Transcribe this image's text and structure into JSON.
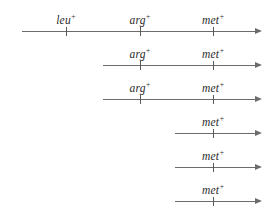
{
  "figure": {
    "type": "genetic-map-conjugation-diagram",
    "background_color": "#ffffff",
    "line_color": "#6c6c6c",
    "tick_color": "#5a5a5a",
    "label_color": "#2b2b2b",
    "canvas": {
      "width": 277,
      "height": 221
    },
    "arrow_tip_x": 262,
    "rows": [
      {
        "row_index": 1,
        "y": 31,
        "line_start_x": 22,
        "line_end_x": 255,
        "markers": [
          {
            "gene": "leu",
            "charge": "+",
            "x": 66
          },
          {
            "gene": "arg",
            "charge": "+",
            "x": 140
          },
          {
            "gene": "met",
            "charge": "+",
            "x": 213
          }
        ]
      },
      {
        "row_index": 2,
        "y": 65,
        "line_start_x": 103,
        "line_end_x": 255,
        "markers": [
          {
            "gene": "arg",
            "charge": "+",
            "x": 140
          },
          {
            "gene": "met",
            "charge": "+",
            "x": 213
          }
        ]
      },
      {
        "row_index": 3,
        "y": 99,
        "line_start_x": 103,
        "line_end_x": 255,
        "markers": [
          {
            "gene": "arg",
            "charge": "+",
            "x": 140
          },
          {
            "gene": "met",
            "charge": "+",
            "x": 213
          }
        ]
      },
      {
        "row_index": 4,
        "y": 133,
        "line_start_x": 175,
        "line_end_x": 255,
        "markers": [
          {
            "gene": "met",
            "charge": "+",
            "x": 213
          }
        ]
      },
      {
        "row_index": 5,
        "y": 167,
        "line_start_x": 175,
        "line_end_x": 255,
        "markers": [
          {
            "gene": "met",
            "charge": "+",
            "x": 213
          }
        ]
      },
      {
        "row_index": 6,
        "y": 201,
        "line_start_x": 175,
        "line_end_x": 255,
        "markers": [
          {
            "gene": "met",
            "charge": "+",
            "x": 213
          }
        ]
      }
    ]
  }
}
